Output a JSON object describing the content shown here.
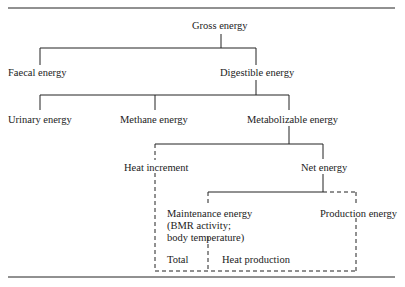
{
  "diagram": {
    "nodes": {
      "gross": "Gross energy",
      "faecal": "Faecal energy",
      "digestible": "Digestible energy",
      "urinary": "Urinary energy",
      "methane": "Methane energy",
      "metabolizable": "Metabolizable energy",
      "heat_increment": "Heat increment",
      "net": "Net energy",
      "maintenance_line1": "Maintenance energy",
      "maintenance_line2": "(BMR activity;",
      "maintenance_line3": "body temperature)",
      "production": "Production energy",
      "total": "Total",
      "heat_production": "Heat production"
    },
    "line_color": "#222222"
  }
}
